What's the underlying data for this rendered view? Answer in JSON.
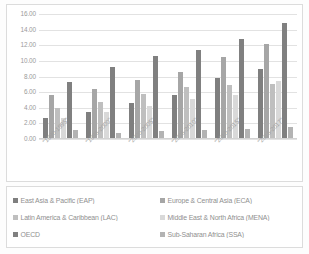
{
  "chart_data": {
    "type": "bar",
    "title": "",
    "subtitle": "",
    "xlabel": "",
    "ylabel": "",
    "ylim": [
      0,
      16
    ],
    "ytick_step": 2,
    "ytick_labels": [
      "0.00",
      "2.00",
      "4.00",
      "6.00",
      "8.00",
      "10.00",
      "12.00",
      "14.00",
      "16.00"
    ],
    "grid": true,
    "legend_position": "bottom",
    "categories": [
      "\"1990-1995\"",
      "\"1995-2000\"",
      "\"2000-2005\"",
      "\"2005-2010\"",
      "\"2010-2015\"",
      "\"2015-2017\""
    ],
    "series": [
      {
        "name": "East Asia & Pacific (EAP)",
        "color": "#7f7f7f",
        "values": [
          2.65,
          3.5,
          4.55,
          5.65,
          7.8,
          8.95
        ]
      },
      {
        "name": "Europe & Central Asia (ECA)",
        "color": "#a6a6a6",
        "values": [
          5.65,
          6.35,
          7.55,
          8.55,
          10.45,
          12.2
        ]
      },
      {
        "name": "Latin America & Caribbean (LAC)",
        "color": "#bfbfbf",
        "values": [
          3.95,
          4.8,
          5.75,
          6.6,
          6.85,
          7.1
        ]
      },
      {
        "name": "Middle East & North Africa (MENA)",
        "color": "#d9d9d9",
        "values": [
          2.75,
          3.4,
          4.25,
          5.15,
          5.6,
          7.45
        ]
      },
      {
        "name": "OECD",
        "color": "#808080",
        "values": [
          7.25,
          9.25,
          10.65,
          11.45,
          12.8,
          14.85
        ]
      },
      {
        "name": "Sub-Saharan Africa (SSA)",
        "color": "#b3b3b3",
        "values": [
          1.2,
          0.8,
          1.0,
          1.15,
          1.3,
          1.5
        ]
      }
    ]
  },
  "legend": {
    "items": [
      {
        "label": "East Asia & Pacific (EAP)",
        "color": "#7f7f7f"
      },
      {
        "label": "Europe & Central Asia (ECA)",
        "color": "#a6a6a6"
      },
      {
        "label": "Latin America & Caribbean (LAC)",
        "color": "#bfbfbf"
      },
      {
        "label": "Middle East & North Africa (MENA)",
        "color": "#d9d9d9"
      },
      {
        "label": "OECD",
        "color": "#808080"
      },
      {
        "label": "Sub-Saharan Africa (SSA)",
        "color": "#b3b3b3"
      }
    ]
  }
}
